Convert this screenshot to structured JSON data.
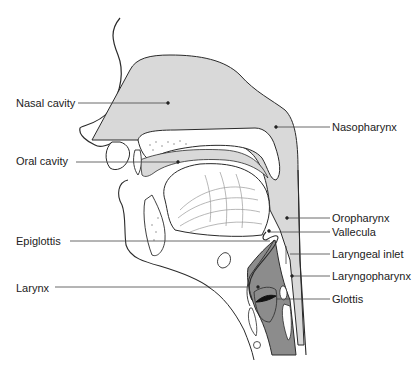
{
  "diagram": {
    "colors": {
      "airway_fill": "#d9d9d9",
      "larynx_fill": "#8c8c8c",
      "outline": "#2a2a2a",
      "background": "#ffffff"
    },
    "labels_left": [
      {
        "id": "nasal-cavity",
        "text": "Nasal cavity"
      },
      {
        "id": "oral-cavity",
        "text": "Oral cavity"
      },
      {
        "id": "epiglottis",
        "text": "Epiglottis"
      },
      {
        "id": "larynx",
        "text": "Larynx"
      }
    ],
    "labels_right": [
      {
        "id": "nasopharynx",
        "text": "Nasopharynx"
      },
      {
        "id": "oropharynx",
        "text": "Oropharynx"
      },
      {
        "id": "vallecula",
        "text": "Vallecula"
      },
      {
        "id": "laryngeal-inlet",
        "text": "Laryngeal inlet"
      },
      {
        "id": "laryngopharynx",
        "text": "Laryngopharynx"
      },
      {
        "id": "glottis",
        "text": "Glottis"
      }
    ]
  }
}
